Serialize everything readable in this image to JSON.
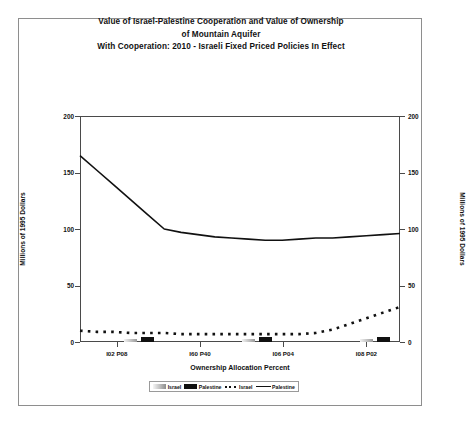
{
  "title": {
    "line1": "Value of Israel-Palestine Cooperation and Value of Ownership",
    "line2": "of Mountain Aquifer",
    "line3": "With Cooperation:  2010 - Israeli Fixed Priced Policies In Effect"
  },
  "legend": {
    "israel_bar": "Israel",
    "palestine_bar": "Palestine",
    "israel_line": "Israel",
    "palestine_line": "Palestine"
  },
  "chart_data": {
    "type": "line",
    "title": "Value of Israel-Palestine Cooperation and Value of Ownership of Mountain Aquifer With Cooperation:  2010 - Israeli Fixed Priced Policies In Effect",
    "xlabel": "Ownership Allocation Percent",
    "ylabel": "Millions of 1995 Dollars",
    "ylabel_right": "Millions of 1995 Dollars",
    "ylim": [
      0,
      200
    ],
    "yticks": [
      0,
      50,
      100,
      150,
      200
    ],
    "xtick_labels": [
      "I02 P08",
      "I60 P40",
      "I06 P04",
      "I08 P02"
    ],
    "xtick_positions": [
      0.115,
      0.375,
      0.635,
      0.895
    ],
    "grid": false,
    "legend_position": "bottom",
    "x_index": [
      0,
      1,
      2,
      3,
      4,
      5,
      6,
      7,
      8,
      9,
      10,
      11,
      12,
      13,
      14,
      15,
      16,
      17,
      18,
      19
    ],
    "series": [
      {
        "name": "Palestine",
        "style": "solid-line",
        "values": [
          165,
          152,
          139,
          126,
          113,
          100,
          97,
          95,
          93,
          92,
          91,
          90,
          90,
          91,
          92,
          92,
          93,
          94,
          95,
          96
        ]
      },
      {
        "name": "Israel",
        "style": "dotted-line",
        "values": [
          10,
          9,
          9,
          8,
          8,
          8,
          7,
          7,
          7,
          7,
          7,
          7,
          7,
          7,
          8,
          11,
          16,
          21,
          26,
          31
        ]
      },
      {
        "name": "Israel",
        "style": "gray-bar",
        "values": [
          0,
          0,
          0,
          3,
          0,
          0,
          0,
          0,
          0,
          0,
          3,
          0,
          0,
          0,
          0,
          0,
          0,
          3,
          0,
          0
        ]
      },
      {
        "name": "Palestine",
        "style": "black-bar",
        "values": [
          0,
          0,
          0,
          0,
          4,
          0,
          0,
          0,
          0,
          0,
          0,
          4,
          0,
          0,
          0,
          0,
          0,
          0,
          4,
          0
        ]
      }
    ]
  }
}
